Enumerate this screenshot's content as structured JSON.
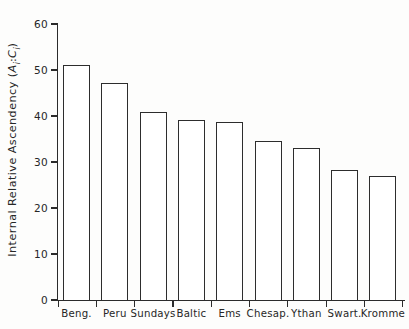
{
  "chart_data": {
    "type": "bar",
    "title": "",
    "subtitle": "",
    "xlabel": "",
    "ylabel": "Internal Relative Ascendency (Ai:Ci)",
    "ylabel_parts": {
      "main": "Internal Relative Ascendency (",
      "sym1": "A",
      "sub1": "i",
      "colon": ":",
      "sym2": "C",
      "sub2": "i",
      "close": ")"
    },
    "categories": [
      "Beng.",
      "Peru",
      "Sundays",
      "Baltic",
      "Ems",
      "Chesap.",
      "Ythan",
      "Swart.",
      "Kromme"
    ],
    "values": [
      51.1,
      47.2,
      40.9,
      39.1,
      38.7,
      34.6,
      33.0,
      28.3,
      27.0
    ],
    "ylim": [
      0,
      60
    ],
    "ytick_labels": [
      "60",
      "50",
      "40",
      "30",
      "20",
      "10",
      "0"
    ],
    "ytick_values": [
      60,
      50,
      40,
      30,
      20,
      10,
      0
    ],
    "grid": false,
    "legend": null,
    "bar_fill_color": "#ffffff",
    "bar_edge_color": "#2d2d2d",
    "axis_color": "#2b2b2b",
    "background_color": "#fdfdfc"
  }
}
